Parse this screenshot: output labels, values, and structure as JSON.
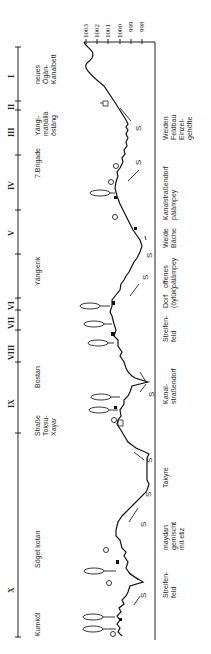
{
  "diagram": {
    "type": "landscape cross-section profile (rotated 90°)",
    "elevation_axis": {
      "ticks": [
        "1003",
        "1002",
        "1001",
        "1000",
        "999",
        "998"
      ]
    },
    "zones": [
      {
        "numeral": "I",
        "place": "neues\nÖgän-\nKanalbett",
        "landuse": "Weiden\nFeldbau\nEinzel-\ngehöfte"
      },
      {
        "numeral": "II",
        "place": "Yängi-\nmäḥällä\nöstäng",
        "landuse": ""
      },
      {
        "numeral": "III",
        "place": "7.Brigade",
        "landuse": "Kanalstraßendorf\npälämpey"
      },
      {
        "numeral": "IV",
        "place": "",
        "landuse": "Weide\nBäche"
      },
      {
        "numeral": "V",
        "place": "Yängierik",
        "landuse": "offenes\npälämpey"
      },
      {
        "numeral": "VI",
        "place": "",
        "landuse": "Dorf\n(öylük)"
      },
      {
        "numeral": "VII",
        "place": "",
        "landuse": "Streifen-\nfeld"
      },
      {
        "numeral": "VIII",
        "place": "Bostan",
        "landuse": "Kanal-\nstraßendorf"
      },
      {
        "numeral": "IX",
        "place": "Straße\nToḳsu-\nXayar",
        "landuse": "Takyre"
      },
      {
        "numeral": "X",
        "place": "Söget ḳotan",
        "landuse": "maydan\ngemischt\nmit etiz"
      },
      {
        "numeral": "",
        "place": "Kumköl",
        "landuse": "Streifen-\nfeld"
      }
    ],
    "flow_marker": "S"
  }
}
